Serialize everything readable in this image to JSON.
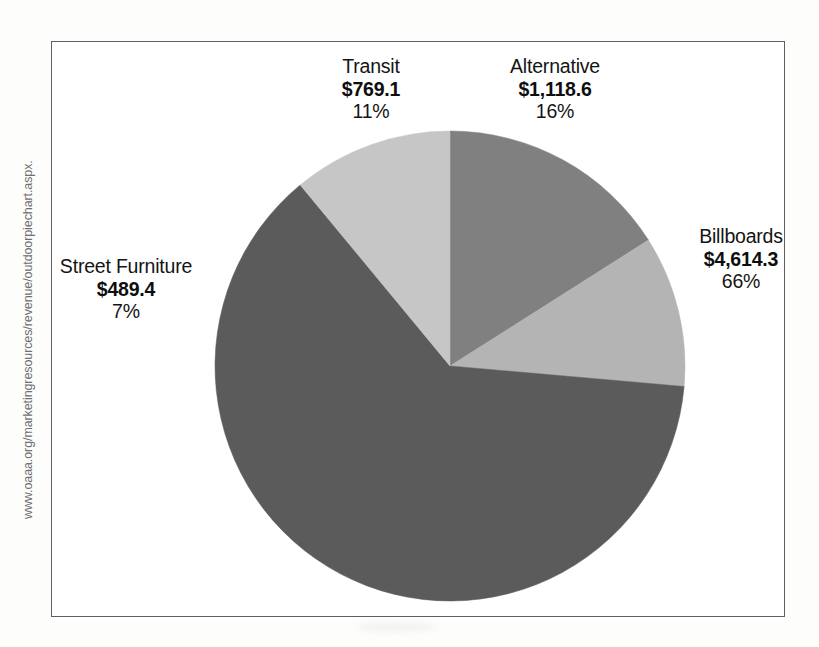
{
  "watermark": {
    "url": "www.oaaa.org/marketingresources/revenue/outdoorpiechart.aspx."
  },
  "chart_data": {
    "type": "pie",
    "title": "",
    "subtitle": "",
    "xlabel": "",
    "ylabel": "",
    "legend_position": "none",
    "grid": false,
    "value_prefix": "$",
    "categories": [
      "Alternative",
      "Billboards",
      "Street Furniture",
      "Transit"
    ],
    "values": [
      1118.6,
      4614.3,
      489.4,
      769.1
    ],
    "percents": [
      16,
      66,
      7,
      11
    ],
    "start_angle_deg": 0,
    "direction": "clockwise",
    "slices": [
      {
        "label": "Alternative",
        "value_text": "$1,118.6",
        "percent_text": "16%",
        "value": 1118.6,
        "percent": 16,
        "color": "#808080",
        "start_deg": 0,
        "end_deg": 57.6
      },
      {
        "label": "Billboards",
        "value_text": "$4,614.3",
        "percent_text": "66%",
        "value": 4614.3,
        "percent": 66,
        "color": "#b4b4b4",
        "start_deg": 57.6,
        "end_deg": 95.0
      },
      {
        "label": "Street Furniture",
        "value_text": "$489.4",
        "percent_text": "7%",
        "value": 489.4,
        "percent": 7,
        "color": "#5b5b5b",
        "start_deg": 95.0,
        "end_deg": 320.4
      },
      {
        "label": "Transit",
        "value_text": "$769.1",
        "percent_text": "11%",
        "value": 769.1,
        "percent": 11,
        "color": "#c6c6c6",
        "start_deg": 320.4,
        "end_deg": 360
      }
    ],
    "geometry": {
      "center_x": 450,
      "center_y": 366,
      "radius": 235
    },
    "colors": {
      "alternative": "#808080",
      "billboards": "#b4b4b4",
      "street_furniture": "#5b5b5b",
      "transit": "#c6c6c6",
      "frame": "#5d5f63",
      "background": "#ffffff"
    }
  }
}
